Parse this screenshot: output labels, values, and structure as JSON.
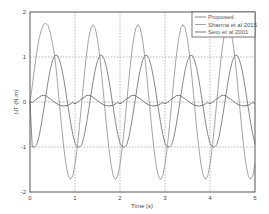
{
  "chart_data": {
    "type": "line",
    "title": "",
    "xlabel": "Time (s)",
    "ylabel": "UT (N.m)",
    "xlim": [
      0,
      5
    ],
    "ylim": [
      -2,
      2
    ],
    "xticks": [
      "0",
      "1",
      "2",
      "3",
      "4",
      "5"
    ],
    "yticks": [
      "-2",
      "-1",
      "0",
      "1",
      "2"
    ],
    "grid": true,
    "legend_position": "upper right",
    "x_step": 0.05,
    "x": [
      0,
      0.05,
      0.1,
      0.15,
      0.2,
      0.25,
      0.3,
      0.35,
      0.4,
      0.45,
      0.5,
      0.55,
      0.6,
      0.65,
      0.7,
      0.75,
      0.8,
      0.85,
      0.9,
      0.95,
      1,
      1.05,
      1.1,
      1.15,
      1.2,
      1.25,
      1.3,
      1.35,
      1.4,
      1.45,
      1.5,
      1.55,
      1.6,
      1.65,
      1.7,
      1.75,
      1.8,
      1.85,
      1.9,
      1.95,
      2,
      2.05,
      2.1,
      2.15,
      2.2,
      2.25,
      2.3,
      2.35,
      2.4,
      2.45,
      2.5,
      2.55,
      2.6,
      2.65,
      2.7,
      2.75,
      2.8,
      2.85,
      2.9,
      2.95,
      3,
      3.05,
      3.1,
      3.15,
      3.2,
      3.25,
      3.3,
      3.35,
      3.4,
      3.45,
      3.5,
      3.55,
      3.6,
      3.65,
      3.7,
      3.75,
      3.8,
      3.85,
      3.9,
      3.95,
      4,
      4.05,
      4.1,
      4.15,
      4.2,
      4.25,
      4.3,
      4.35,
      4.4,
      4.45,
      4.5,
      4.55,
      4.6,
      4.65,
      4.7,
      4.75,
      4.8,
      4.85,
      4.9,
      4.95,
      5
    ],
    "series": [
      {
        "name": "Proposed",
        "color": "#7a7a7a",
        "values": [
          0,
          -1,
          -1,
          -0.95,
          -0.77,
          -0.51,
          -0.2,
          0.13,
          0.45,
          0.72,
          0.92,
          1.03,
          1.04,
          0.95,
          0.77,
          0.51,
          0.2,
          -0.13,
          -0.45,
          -0.72,
          -0.92,
          -1,
          -1,
          -0.95,
          -0.77,
          -0.51,
          -0.2,
          0.13,
          0.45,
          0.72,
          0.92,
          1.03,
          1.04,
          0.95,
          0.77,
          0.51,
          0.2,
          -0.13,
          -0.45,
          -0.72,
          -0.92,
          -1,
          -1,
          -0.95,
          -0.77,
          -0.51,
          -0.2,
          0.13,
          0.45,
          0.72,
          0.92,
          1.03,
          1.04,
          0.95,
          0.77,
          0.51,
          0.2,
          -0.13,
          -0.45,
          -0.72,
          -0.92,
          -1,
          -1,
          -0.95,
          -0.77,
          -0.51,
          -0.2,
          0.13,
          0.45,
          0.72,
          0.92,
          1.03,
          1.04,
          0.95,
          0.77,
          0.51,
          0.2,
          -0.13,
          -0.45,
          -0.72,
          -0.92,
          -1,
          -1,
          -0.95,
          -0.77,
          -0.51,
          -0.2,
          0.13,
          0.45,
          0.72,
          0.92,
          1.03,
          1.04,
          0.95,
          0.77,
          0.51,
          0.2,
          -0.13,
          -0.45,
          -0.72,
          -0.92
        ]
      },
      {
        "name": "Sharma et al 2015",
        "color": "#9a9a9a",
        "values": [
          0,
          0.35,
          0.75,
          1.1,
          1.4,
          1.6,
          1.72,
          1.75,
          1.7,
          1.55,
          1.3,
          1.0,
          0.55,
          0,
          -0.53,
          -1.01,
          -1.39,
          -1.64,
          -1.72,
          -1.64,
          -1.39,
          -1.01,
          -0.53,
          0,
          0.53,
          1.01,
          1.39,
          1.64,
          1.72,
          1.64,
          1.39,
          1.01,
          0.53,
          0,
          -0.53,
          -1.01,
          -1.39,
          -1.64,
          -1.72,
          -1.64,
          -1.39,
          -1.01,
          -0.53,
          0,
          0.53,
          1.01,
          1.39,
          1.64,
          1.72,
          1.64,
          1.39,
          1.01,
          0.53,
          0,
          -0.53,
          -1.01,
          -1.39,
          -1.64,
          -1.72,
          -1.64,
          -1.39,
          -1.01,
          -0.53,
          0,
          0.53,
          1.01,
          1.39,
          1.64,
          1.72,
          1.64,
          1.39,
          1.01,
          0.53,
          0,
          -0.53,
          -1.01,
          -1.39,
          -1.64,
          -1.72,
          -1.64,
          -1.39,
          -1.01,
          -0.53,
          0,
          0.53,
          1.01,
          1.39,
          1.64,
          1.72,
          1.64,
          1.39,
          1.01,
          0.53,
          0,
          -0.53,
          -1.01,
          -1.39,
          -1.64,
          -1.72,
          -1.64,
          -1.39
        ]
      },
      {
        "name": "Seto et al 2001",
        "color": "#6a6a6a",
        "values": [
          0,
          -0.01,
          0.03,
          0.07,
          0.1,
          0.14,
          0.15,
          0.14,
          0.1,
          0.07,
          0.03,
          -0.01,
          -0.04,
          -0.07,
          -0.08,
          -0.09,
          -0.08,
          -0.07,
          -0.04,
          -0.01,
          -0.04,
          -0.01,
          0.03,
          0.07,
          0.1,
          0.14,
          0.15,
          0.14,
          0.1,
          0.07,
          0.03,
          -0.01,
          -0.04,
          -0.07,
          -0.08,
          -0.09,
          -0.08,
          -0.07,
          -0.04,
          -0.01,
          -0.04,
          -0.01,
          0.03,
          0.07,
          0.1,
          0.14,
          0.15,
          0.14,
          0.1,
          0.07,
          0.03,
          -0.01,
          -0.04,
          -0.07,
          -0.08,
          -0.09,
          -0.08,
          -0.07,
          -0.04,
          -0.01,
          -0.04,
          -0.01,
          0.03,
          0.07,
          0.1,
          0.14,
          0.15,
          0.14,
          0.1,
          0.07,
          0.03,
          -0.01,
          -0.04,
          -0.07,
          -0.08,
          -0.09,
          -0.08,
          -0.07,
          -0.04,
          -0.01,
          -0.04,
          -0.01,
          0.03,
          0.07,
          0.1,
          0.14,
          0.15,
          0.14,
          0.1,
          0.07,
          0.03,
          -0.01,
          -0.04,
          -0.07,
          -0.08,
          -0.09,
          -0.08,
          -0.07,
          -0.04,
          -0.01,
          -0.04
        ]
      }
    ]
  },
  "legend": {
    "items": [
      "Proposed",
      "Sharma et al 2015",
      "Seto et al 2001"
    ]
  },
  "axes": {
    "xlabel": "Time (s)",
    "ylabel": "UT (N.m)",
    "xticks": [
      "0",
      "1",
      "2",
      "3",
      "4",
      "5"
    ],
    "yticks": [
      "2",
      "1",
      "0",
      "-1",
      "-2"
    ]
  },
  "colors": {
    "axis": "#555555",
    "grid": "#888888",
    "background": "#ffffff"
  }
}
